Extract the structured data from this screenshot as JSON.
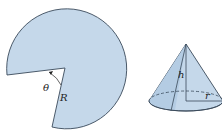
{
  "figure": {
    "sector": {
      "label_angle": "θ",
      "label_radius": "R",
      "fill": "#c5d8ea",
      "stroke": "#3a4a5a"
    },
    "cone": {
      "label_height": "h",
      "label_radius": "r",
      "fill": "#c5d8ea",
      "stroke": "#3a4a5a"
    }
  }
}
